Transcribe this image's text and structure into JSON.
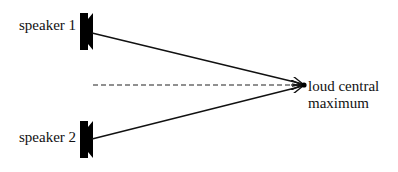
{
  "diagram": {
    "type": "two-source interference",
    "speakers": [
      {
        "id": "speaker-1",
        "label": "speaker 1"
      },
      {
        "id": "speaker-2",
        "label": "speaker 2"
      }
    ],
    "target": {
      "label_line1": "loud central",
      "label_line2": "maximum"
    },
    "line_color": "#111111",
    "speaker_color": "#000000",
    "dashed_line": "central axis"
  }
}
